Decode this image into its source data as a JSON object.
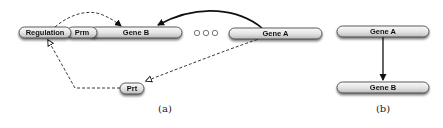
{
  "figure": {
    "panel_a": {
      "caption": "(a)",
      "nodes": {
        "regulation": "Regulation",
        "prm": "Prm",
        "gene_b": "Gene B",
        "gene_a": "Gene A",
        "prt": "Prt"
      },
      "ellipsis_circles": 3,
      "edges": [
        {
          "from": "Gene A",
          "to": "Gene B",
          "style": "solid",
          "arrow": "filled"
        },
        {
          "from": "Regulation",
          "to": "Gene B",
          "style": "dashed",
          "arrow": "filled"
        },
        {
          "from": "Gene A",
          "to": "Prt",
          "style": "dashed",
          "arrow": "open"
        },
        {
          "from": "Prt",
          "to": "Regulation",
          "style": "dashed",
          "arrow": "open"
        }
      ]
    },
    "panel_b": {
      "caption": "(b)",
      "nodes": {
        "gene_a": "Gene A",
        "gene_b": "Gene B"
      },
      "edges": [
        {
          "from": "Gene A",
          "to": "Gene B",
          "style": "solid",
          "arrow": "filled"
        }
      ]
    },
    "colors": {
      "pill_fill_top": "#f4f4f4",
      "pill_fill_bottom": "#c8c8c8",
      "pill_stroke": "#333333",
      "edge": "#222222"
    }
  }
}
